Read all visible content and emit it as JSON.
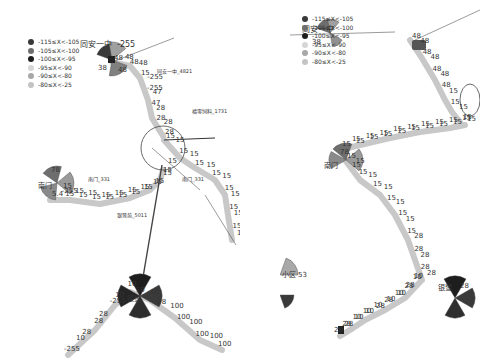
{
  "legend": {
    "items": [
      {
        "label": "-115≤X<-105",
        "color": "#3a3a3a"
      },
      {
        "label": "-105≤X<-100",
        "color": "#6e6e6e"
      },
      {
        "label": "-100≤X<-95",
        "color": "#1e1e1e"
      },
      {
        "label": "-95≤X<-90",
        "color": "#d6d6d6"
      },
      {
        "label": "-90≤X<-80",
        "color": "#a8a8a8"
      },
      {
        "label": "-80≤X<-25",
        "color": "#c4c4c4"
      }
    ]
  },
  "left_map": {
    "site_labels": {
      "tongan_top": "同安一中",
      "tongan_top_value": "-255",
      "tongan_link": "同安一中_4821",
      "fuyou": "福零饲料_1731",
      "nanmen_left_link": "南门_331",
      "nanmen_right_link": "南门_331",
      "nanmen_site": "南门",
      "yinlu_link": "银鹭苑_5011",
      "yinlu_site": "银鹭"
    },
    "top_route_values": [
      "48",
      "48",
      "48",
      "48",
      "15",
      "-255",
      "-255",
      "47",
      "47",
      "28",
      "28",
      "28",
      "28"
    ],
    "left_route_values": [
      "5.4",
      "-255",
      "15",
      "15",
      "15",
      "15",
      "15",
      "15",
      "15",
      "15",
      "15",
      "15",
      "15",
      "15",
      "15",
      "15",
      "15",
      "15",
      "15",
      "15"
    ],
    "right_route_values": [
      "15",
      "15",
      "15",
      "15",
      "15",
      "15",
      "15",
      "15",
      "15",
      "15",
      "15",
      "15",
      "15",
      "15"
    ],
    "bottom_route_values": [
      "-255",
      "10",
      "28",
      "28",
      "28",
      "-255",
      "10",
      "10",
      "10",
      "10",
      "28",
      "100",
      "100",
      "100",
      "100",
      "100",
      "100"
    ],
    "sector_values": {
      "tongan_a": "38",
      "tongan_b": "48",
      "nanmen_a": "78",
      "nanmen_b": "15"
    }
  },
  "right_map": {
    "site_labels": {
      "tongan_top": "同安一中",
      "nanmen_site": "南门",
      "xiaoqu": "小区",
      "xiaoqu_value": "53",
      "yinlu_site": "银鹭"
    },
    "top_route_values": [
      "48",
      "48",
      "48",
      "48",
      "48",
      "48",
      "48",
      "15",
      "15",
      "15",
      "15"
    ],
    "mid_route_values": [
      "15",
      "15",
      "15",
      "15",
      "15",
      "15",
      "15",
      "15",
      "15",
      "15",
      "15",
      "15",
      "15",
      "15",
      "15",
      "15",
      "15",
      "15",
      "15"
    ],
    "down_route_values": [
      "15",
      "15",
      "15",
      "15",
      "15",
      "15",
      "15",
      "15",
      "15",
      "15",
      "15",
      "28",
      "28",
      "28",
      "28",
      "28"
    ],
    "bottom_route_values": [
      "10",
      "10",
      "28",
      "28",
      "10",
      "10",
      "10",
      "28",
      "28",
      "10",
      "10",
      "10",
      "10",
      "10",
      "28",
      "28",
      "28"
    ],
    "sector_values": {
      "tongan_a": "38",
      "nanmen_a": "78",
      "nanmen_b": "15",
      "yinlu_value": "28",
      "xiaoqu_low": "64"
    }
  }
}
